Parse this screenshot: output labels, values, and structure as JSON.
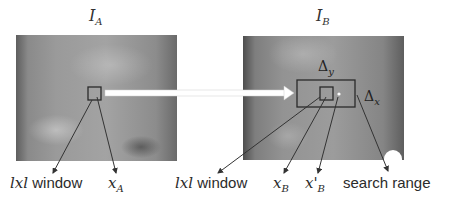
{
  "panels": {
    "left": {
      "title_base": "I",
      "title_sub": "A"
    },
    "right": {
      "title_base": "I",
      "title_sub": "B"
    }
  },
  "search_range_labels": {
    "delta_y": {
      "symbol": "Δ",
      "sub": "y"
    },
    "delta_x": {
      "symbol": "Δ",
      "sub": "x"
    }
  },
  "labels": {
    "left_window": {
      "prefix": "lxl",
      "text": " window"
    },
    "x_a": {
      "base": "x",
      "sub": "A"
    },
    "right_window": {
      "prefix": "lxl",
      "text": " window"
    },
    "x_b": {
      "base": "x",
      "sub": "B"
    },
    "x_prime_b": {
      "base": "x'",
      "sub": "B"
    },
    "search_range": "search range"
  },
  "colors": {
    "arrow": "#333333",
    "transfer_arrow": "#ffffff",
    "box_stroke": "#2a2a2a"
  }
}
